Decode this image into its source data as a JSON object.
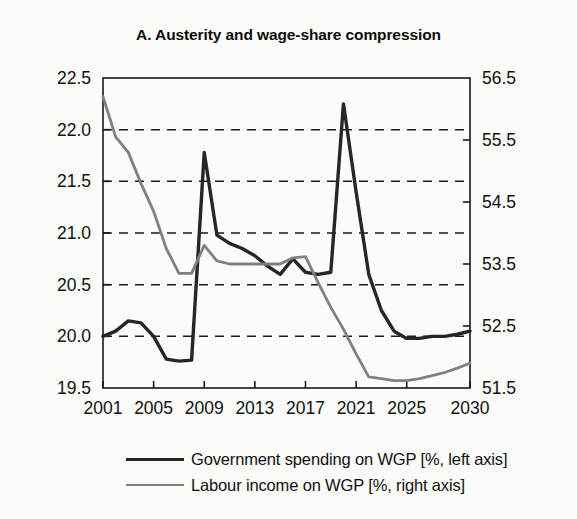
{
  "chart_data": {
    "type": "line",
    "title": "A. Austerity and wage-share compression",
    "xlabel": "",
    "ylabel": "",
    "grid": true,
    "legend_position": "bottom",
    "x": [
      2001,
      2002,
      2003,
      2004,
      2005,
      2006,
      2007,
      2008,
      2009,
      2010,
      2011,
      2012,
      2013,
      2014,
      2015,
      2016,
      2017,
      2018,
      2019,
      2020,
      2021,
      2022,
      2023,
      2024,
      2025,
      2026,
      2027,
      2028,
      2029,
      2030
    ],
    "xticks": [
      "2001",
      "2005",
      "2009",
      "2013",
      "2017",
      "2021",
      "2025",
      "2030"
    ],
    "xtick_values": [
      2001,
      2005,
      2009,
      2013,
      2017,
      2021,
      2025,
      2030
    ],
    "left_axis": {
      "ylim": [
        19.5,
        22.5
      ],
      "yticks": [
        "19.5",
        "20.0",
        "20.5",
        "21.0",
        "21.5",
        "22.0",
        "22.5"
      ],
      "ytick_values": [
        19.5,
        20.0,
        20.5,
        21.0,
        21.5,
        22.0,
        22.5
      ]
    },
    "right_axis": {
      "ylim": [
        51.5,
        56.5
      ],
      "yticks": [
        "51.5",
        "52.5",
        "53.5",
        "54.5",
        "55.5",
        "56.5"
      ],
      "ytick_values": [
        51.5,
        52.5,
        53.5,
        54.5,
        55.5,
        56.5
      ]
    },
    "series": [
      {
        "name": "Government spending on WGP [%, left axis]",
        "axis": "left",
        "color": "#262626",
        "values": [
          20.0,
          20.05,
          20.15,
          20.13,
          20.0,
          19.78,
          19.76,
          19.77,
          21.78,
          20.98,
          20.9,
          20.85,
          20.78,
          20.68,
          20.6,
          20.75,
          20.62,
          20.6,
          20.62,
          22.25,
          21.4,
          20.6,
          20.25,
          20.05,
          19.98,
          19.98,
          20.0,
          20.0,
          20.02,
          20.05
        ]
      },
      {
        "name": "Labour income on WGP [%, right axis]",
        "axis": "right",
        "color": "#808080",
        "values": [
          56.2,
          55.55,
          55.3,
          54.8,
          54.35,
          53.75,
          53.35,
          53.35,
          53.8,
          53.55,
          53.5,
          53.5,
          53.5,
          53.5,
          53.5,
          53.6,
          53.62,
          53.2,
          52.8,
          52.45,
          52.05,
          51.68,
          51.65,
          51.62,
          51.62,
          51.65,
          51.7,
          51.75,
          51.82,
          51.9
        ]
      }
    ]
  },
  "legend": {
    "items": [
      {
        "label": "Government spending on WGP [%, left axis]",
        "color": "#262626"
      },
      {
        "label": "Labour income on WGP [%, right axis]",
        "color": "#808080"
      }
    ]
  }
}
